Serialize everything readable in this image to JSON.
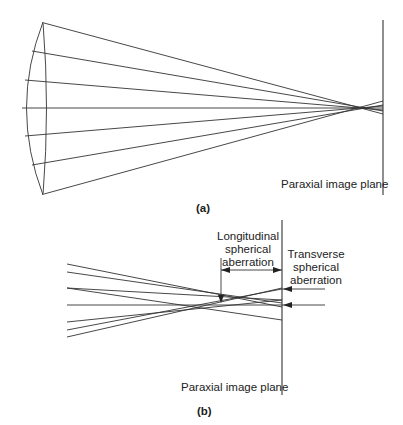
{
  "figure": {
    "panel_a": {
      "caption": "(a)",
      "plane_label": "Paraxial image plane",
      "elements": [
        "lens",
        "rays",
        "paraxial-image-plane"
      ]
    },
    "panel_b": {
      "caption": "(b)",
      "plane_label": "Paraxial image plane",
      "longitudinal_label_1": "Longitudinal",
      "longitudinal_label_2": "spherical",
      "longitudinal_label_3": "aberration",
      "transverse_label_1": "Transverse",
      "transverse_label_2": "spherical",
      "transverse_label_3": "aberration"
    },
    "colors": {
      "line": "#333333",
      "text": "#222222",
      "background": "#ffffff"
    }
  }
}
